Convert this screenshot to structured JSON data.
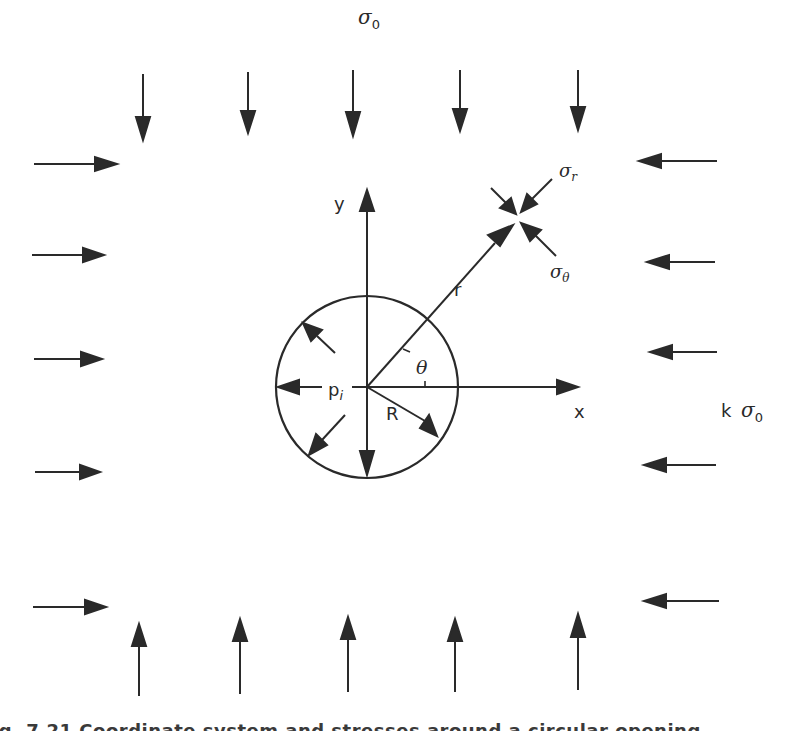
{
  "diagram": {
    "colors": {
      "ink": "#2a2a2a",
      "background": "#ffffff"
    },
    "labels": {
      "top_stress": "σ",
      "top_stress_sub": "0",
      "side_stress_k": "k",
      "side_stress": "σ",
      "side_stress_sub": "0",
      "y_axis": "y",
      "x_axis": "x",
      "radius_vector": "r",
      "angle": "θ",
      "internal_pressure": "p",
      "internal_pressure_sub": "i",
      "hole_radius": "R",
      "element_radial_stress": "σ",
      "element_radial_stress_sub": "r",
      "element_tangential_stress": "σ",
      "element_tangential_stress_sub": "θ"
    },
    "arrows": {
      "top_count": 5,
      "bottom_count": 5,
      "left_count": 5,
      "right_count": 5,
      "internal_pressure_count": 5
    },
    "caption": "Fig. 7.21 Coordinate system and stresses around a circular opening"
  }
}
